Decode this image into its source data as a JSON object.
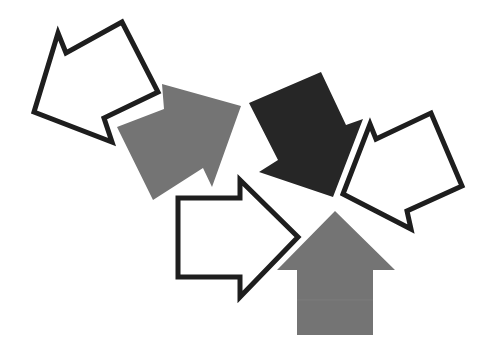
{
  "illustration": {
    "title": "Arrows converging toward a center point",
    "width": 490,
    "height": 360,
    "background": "#ffffff",
    "colors": {
      "outline_stroke": "#1e1e1e",
      "outline_fill": "#ffffff",
      "gray_fill": "#747474",
      "dark_fill": "#262626",
      "band_line": "#808080"
    },
    "arrows": [
      {
        "id": "outlined-left",
        "style": "outline",
        "direction": "up-left",
        "points": "58,33 66,53 122,22 158,92 104,118 112,142 34,112"
      },
      {
        "id": "gray-top",
        "style": "gray",
        "direction": "up-right",
        "points": "117,127 164,109 162,84 241,106 212,187 203,168 153,200"
      },
      {
        "id": "dark-top",
        "style": "dark",
        "direction": "down-right",
        "points": "249,103 321,72 346,125 363,119 333,197 259,172 278,160"
      },
      {
        "id": "outlined-right",
        "style": "outline",
        "direction": "down-left",
        "points": "343,194 370,124 376,139 431,113 462,186 407,211 411,229"
      },
      {
        "id": "outlined-middle",
        "style": "outline",
        "direction": "right",
        "points": "178,198 240,198 240,180 298,237 240,297 240,277 178,277"
      },
      {
        "id": "gray-bottom",
        "style": "gray",
        "direction": "up",
        "points": "335,211 395,270 373,270 373,335 297,335 297,270 277,270"
      }
    ]
  }
}
